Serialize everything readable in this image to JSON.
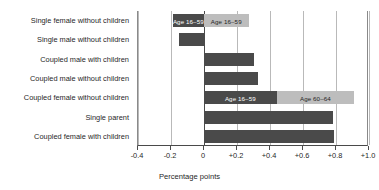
{
  "chart_data": {
    "type": "bar",
    "orientation": "horizontal",
    "title": "",
    "xlabel": "Percentage points",
    "ylabel": "",
    "xlim": [
      -0.4,
      1.0
    ],
    "xticks": [
      -0.4,
      -0.2,
      0,
      0.2,
      0.4,
      0.6,
      0.8,
      1.0
    ],
    "xtick_labels": [
      "-0.4",
      "-0.2",
      "0",
      "+0.2",
      "+0.4",
      "+0.6",
      "+0.8",
      "+1.0"
    ],
    "grid": "vertical",
    "legend": "none",
    "series": [
      {
        "name": "Age 16-59",
        "color": "#4a4a4a"
      },
      {
        "name": "Age 60-64",
        "color": "#bdbdbd"
      }
    ],
    "categories": [
      "Single female without children",
      "Single male without children",
      "Coupled male with children",
      "Coupled male without children",
      "Coupled female without children",
      "Single parent",
      "Coupled female with children"
    ],
    "bars": [
      {
        "category": "Single female without children",
        "segments": [
          {
            "series": "Age 16-59",
            "start": -0.19,
            "end": 0,
            "value": -0.19,
            "label": "Age 16–59"
          },
          {
            "series": "Age 60-64",
            "start": 0,
            "end": 0.27,
            "value": 0.27,
            "label": "Age 16–59"
          }
        ]
      },
      {
        "category": "Single male without children",
        "segments": [
          {
            "series": "Age 16-59",
            "start": -0.15,
            "end": 0,
            "value": -0.15,
            "label": ""
          }
        ]
      },
      {
        "category": "Coupled male with children",
        "segments": [
          {
            "series": "Age 16-59",
            "start": 0,
            "end": 0.3,
            "value": 0.3,
            "label": ""
          }
        ]
      },
      {
        "category": "Coupled male without children",
        "segments": [
          {
            "series": "Age 16-59",
            "start": 0,
            "end": 0.33,
            "value": 0.33,
            "label": ""
          }
        ]
      },
      {
        "category": "Coupled female without children",
        "segments": [
          {
            "series": "Age 16-59",
            "start": 0,
            "end": 0.44,
            "value": 0.44,
            "label": "Age 16–59"
          },
          {
            "series": "Age 60-64",
            "start": 0.44,
            "end": 0.91,
            "value": 0.47,
            "label": "Age 60–64"
          }
        ]
      },
      {
        "category": "Single parent",
        "segments": [
          {
            "series": "Age 16-59",
            "start": 0,
            "end": 0.78,
            "value": 0.78,
            "label": ""
          }
        ]
      },
      {
        "category": "Coupled female with children",
        "segments": [
          {
            "series": "Age 16-59",
            "start": 0,
            "end": 0.79,
            "value": 0.79,
            "label": ""
          }
        ]
      }
    ]
  }
}
